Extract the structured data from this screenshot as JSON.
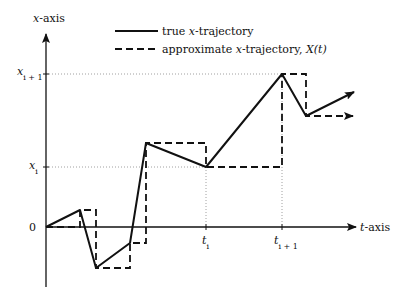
{
  "figure": {
    "y_axis_label_var": "x",
    "y_axis_label_rest": "-axis",
    "t_axis_label_var": "t",
    "t_axis_label_rest": "-axis",
    "origin_label": "0",
    "y_ticks": [
      {
        "var": "x",
        "sub": "i + 1"
      },
      {
        "var": "x",
        "sub": "i"
      }
    ],
    "t_ticks": [
      {
        "var": "t",
        "sub": "i"
      },
      {
        "var": "t",
        "sub": "i + 1"
      }
    ]
  },
  "legend": {
    "solid": {
      "pre": "true ",
      "var": "x",
      "post": "-trajectory"
    },
    "dashed": {
      "pre": "approximate ",
      "var": "x",
      "post": "-trajectory, ",
      "func": "X",
      "arg": "(t)"
    }
  },
  "colors": {
    "line": "#111111",
    "guide": "#888888",
    "background": "#ffffff"
  }
}
